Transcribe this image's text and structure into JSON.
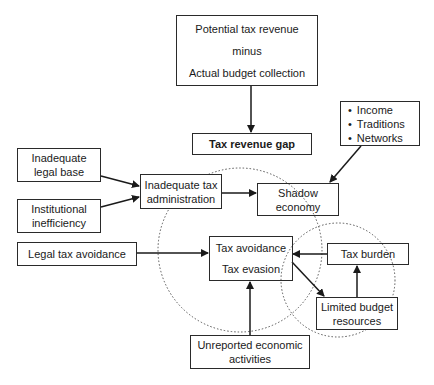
{
  "diagram": {
    "type": "flow-diagram",
    "nodes": {
      "potential": {
        "lines": [
          "Potential tax revenue",
          "minus",
          "Actual budget collection"
        ]
      },
      "gap": {
        "label": "Tax revenue gap"
      },
      "factors": {
        "items": [
          "Income",
          "Traditions",
          "Networks"
        ]
      },
      "legal_base": {
        "lines": [
          "Inadequate",
          "legal base"
        ]
      },
      "institutional": {
        "lines": [
          "Institutional",
          "inefficiency"
        ]
      },
      "tax_admin": {
        "lines": [
          "Inadequate tax",
          "administration"
        ]
      },
      "shadow": {
        "lines": [
          "Shadow",
          "economy"
        ]
      },
      "legal_avoidance": {
        "label": "Legal tax avoidance"
      },
      "avoid_evasion": {
        "lines": [
          "Tax avoidance",
          "Tax evasion"
        ]
      },
      "tax_burden": {
        "label": "Tax burden"
      },
      "limited_budget": {
        "lines": [
          "Limited budget",
          "resources"
        ]
      },
      "unreported": {
        "lines": [
          "Unreported economic",
          "activities"
        ]
      }
    },
    "edges": [
      {
        "from": "Potential tax revenue minus Actual budget collection",
        "to": "Tax revenue gap"
      },
      {
        "from": "Inadequate legal base",
        "to": "Inadequate tax administration"
      },
      {
        "from": "Institutional inefficiency",
        "to": "Inadequate tax administration"
      },
      {
        "from": "Inadequate tax administration",
        "to": "Shadow economy"
      },
      {
        "from": "Income / Traditions / Networks",
        "to": "Shadow economy"
      },
      {
        "from": "Legal tax avoidance",
        "to": "Tax avoidance / Tax evasion"
      },
      {
        "from": "Tax burden",
        "to": "Tax avoidance / Tax evasion"
      },
      {
        "from": "Tax avoidance / Tax evasion",
        "to": "Limited budget resources"
      },
      {
        "from": "Limited budget resources",
        "to": "Tax burden"
      },
      {
        "from": "Unreported economic activities",
        "to": "Tax avoidance / Tax evasion"
      }
    ],
    "colors": {
      "line": "#1a1a1a",
      "circle": "#555555",
      "background": "#ffffff"
    }
  }
}
